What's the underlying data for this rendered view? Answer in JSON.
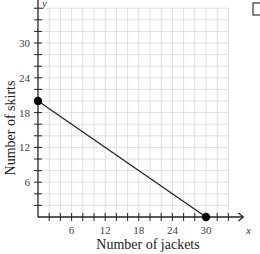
{
  "chart_data": {
    "type": "line",
    "title": "",
    "xlabel": "Number of jackets",
    "ylabel": "Number of skirts",
    "x_var": "x",
    "y_var": "y",
    "xlim": [
      0,
      34
    ],
    "ylim": [
      0,
      36
    ],
    "x_ticks": [
      6,
      12,
      18,
      24,
      30
    ],
    "y_ticks": [
      6,
      12,
      18,
      24,
      30
    ],
    "x_minor_step": 2,
    "y_minor_step": 2,
    "grid": true,
    "series": [
      {
        "name": "constraint line",
        "points": [
          [
            0,
            20
          ],
          [
            30,
            0
          ]
        ],
        "endpoints_marked": true
      }
    ]
  },
  "ui": {
    "checkbox_checked": false
  }
}
